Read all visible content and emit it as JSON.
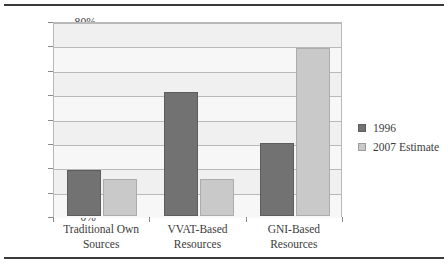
{
  "chart_data": {
    "type": "bar",
    "title": "",
    "xlabel": "",
    "ylabel": "",
    "ylim": [
      0,
      80
    ],
    "ytick_step": 10,
    "grid": true,
    "legend_position": "right",
    "categories": [
      "Traditional Own Sources",
      "VVAT-Based Resources",
      "GNI-Based Resources"
    ],
    "category_lines": [
      [
        "Traditional Own",
        "Sources"
      ],
      [
        "VVAT-Based",
        "Resources"
      ],
      [
        "GNI-Based",
        "Resources"
      ]
    ],
    "ytick_labels": [
      "80%",
      "70%",
      "60%",
      "50%",
      "40%",
      "30%",
      "20%",
      "10%",
      "0%"
    ],
    "ytick_values": [
      80,
      70,
      60,
      50,
      40,
      30,
      20,
      10,
      0
    ],
    "series": [
      {
        "name": "1996",
        "color": "#727272",
        "values": [
          19,
          51,
          30
        ]
      },
      {
        "name": "2007 Estimate",
        "color": "#c9c9c9",
        "values": [
          15,
          15,
          69
        ]
      }
    ],
    "value_unit": "%"
  },
  "legend": {
    "items": [
      {
        "label": "1996",
        "swatch": "series-1-swatch"
      },
      {
        "label": "2007 Estimate",
        "swatch": "series-2-swatch"
      }
    ]
  }
}
